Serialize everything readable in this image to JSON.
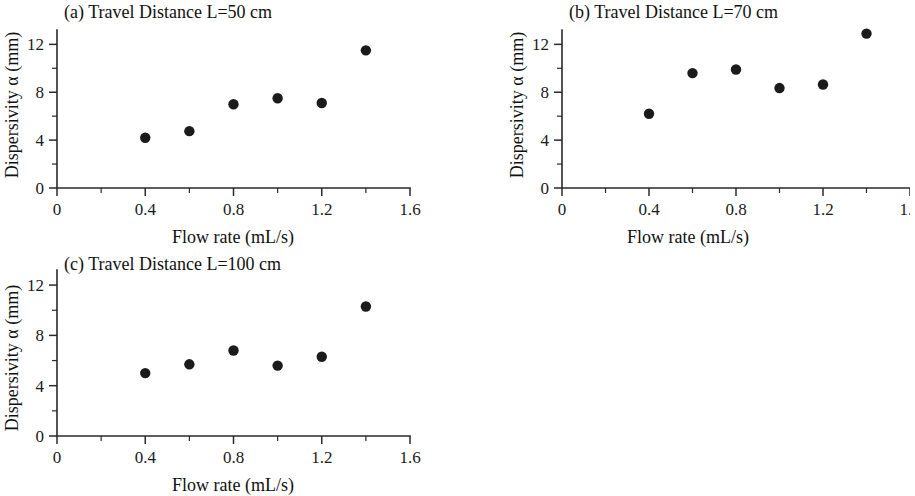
{
  "figure": {
    "background_color": "#ffffff",
    "marker_color": "#1b1b1b",
    "axis_color": "#2a2a2a",
    "layout": "2x2 grid, bottom-right cell empty"
  },
  "axis_labels": {
    "xlabel": "Flow rate (mL/s)",
    "ylabel": "Dispersivity α (mm)"
  },
  "xticks": [
    "0",
    "0.4",
    "0.8",
    "1.2",
    "1.6"
  ],
  "yticks": [
    "0",
    "4",
    "8",
    "12"
  ],
  "panels": {
    "a": {
      "title": "(a)  Travel Distance L=50 cm"
    },
    "b": {
      "title": "(b) Travel Distance L=70 cm"
    },
    "c": {
      "title": "(c) Travel Distance L=100 cm"
    }
  },
  "chart_data": [
    {
      "type": "scatter",
      "panel": "a",
      "title": "(a)  Travel Distance L=50 cm",
      "xlabel": "Flow rate (mL/s)",
      "ylabel": "Dispersivity α (mm)",
      "xlim": [
        0,
        1.6
      ],
      "ylim": [
        0,
        13.2
      ],
      "xticks": [
        0,
        0.4,
        0.8,
        1.2,
        1.6
      ],
      "yticks": [
        0,
        4,
        8,
        12
      ],
      "xminor_step": 0.2,
      "yminor_step": 2,
      "grid": false,
      "legend": "none",
      "x": [
        0.4,
        0.6,
        0.8,
        1.0,
        1.2,
        1.4
      ],
      "y": [
        4.2,
        4.75,
        7.0,
        7.5,
        7.1,
        11.5
      ]
    },
    {
      "type": "scatter",
      "panel": "b",
      "title": "(b) Travel Distance L=70 cm",
      "xlabel": "Flow rate (mL/s)",
      "ylabel": "Dispersivity α (mm)",
      "xlim": [
        0,
        1.6
      ],
      "ylim": [
        0,
        13.2
      ],
      "xticks": [
        0,
        0.4,
        0.8,
        1.2,
        1.6
      ],
      "yticks": [
        0,
        4,
        8,
        12
      ],
      "xminor_step": 0.2,
      "yminor_step": 2,
      "grid": false,
      "legend": "none",
      "x": [
        0.4,
        0.6,
        0.8,
        1.0,
        1.2,
        1.4
      ],
      "y": [
        6.2,
        9.6,
        9.9,
        8.35,
        8.65,
        12.9
      ]
    },
    {
      "type": "scatter",
      "panel": "c",
      "title": "(c) Travel Distance L=100 cm",
      "xlabel": "Flow rate (mL/s)",
      "ylabel": "Dispersivity α (mm)",
      "xlim": [
        0,
        1.6
      ],
      "ylim": [
        0,
        13.2
      ],
      "xticks": [
        0,
        0.4,
        0.8,
        1.2,
        1.6
      ],
      "yticks": [
        0,
        4,
        8,
        12
      ],
      "xminor_step": 0.2,
      "yminor_step": 2,
      "grid": false,
      "legend": "none",
      "x": [
        0.4,
        0.6,
        0.8,
        1.0,
        1.2,
        1.4
      ],
      "y": [
        5.0,
        5.7,
        6.8,
        5.6,
        6.3,
        10.3
      ]
    }
  ]
}
